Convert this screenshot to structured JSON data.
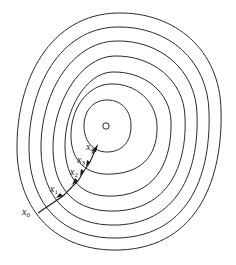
{
  "diagram": {
    "type": "contour-plot-gradient-descent",
    "minimum_marker": "o",
    "contour_count": 7,
    "points": [
      {
        "name": "x",
        "sub": "0",
        "x": 22,
        "y": 215
      },
      {
        "name": "x",
        "sub": "1",
        "x": 50,
        "y": 192
      },
      {
        "name": "x",
        "sub": "2",
        "x": 70,
        "y": 175
      },
      {
        "name": "x",
        "sub": "3",
        "x": 77,
        "y": 163
      },
      {
        "name": "x",
        "sub": "4",
        "x": 86,
        "y": 150
      }
    ],
    "colors": {
      "stroke": "#2a2a2a",
      "background": "#ffffff"
    }
  }
}
